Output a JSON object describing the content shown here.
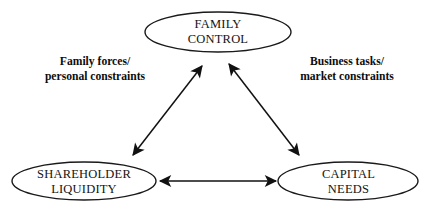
{
  "diagram": {
    "background_color": "#ffffff",
    "stroke_color": "#1a1a1a",
    "text_color": "#141414",
    "nodes": [
      {
        "id": "family-control",
        "line1": "FAMILY",
        "line2": "CONTROL",
        "cx": 218,
        "cy": 32,
        "rx": 73,
        "ry": 20
      },
      {
        "id": "shareholder-liquidity",
        "line1": "SHAREHOLDER",
        "line2": "LIQUIDITY",
        "cx": 84,
        "cy": 181,
        "rx": 72,
        "ry": 19
      },
      {
        "id": "capital-needs",
        "line1": "CAPITAL",
        "line2": "NEEDS",
        "cx": 348,
        "cy": 181,
        "rx": 70,
        "ry": 19
      }
    ],
    "edges": [
      {
        "id": "edge-left",
        "from": "shareholder-liquidity",
        "to": "family-control",
        "x1": 133,
        "y1": 155,
        "x2": 202,
        "y2": 66,
        "double_headed": true
      },
      {
        "id": "edge-right",
        "from": "family-control",
        "to": "capital-needs",
        "x1": 229,
        "y1": 64,
        "x2": 299,
        "y2": 155,
        "double_headed": true
      },
      {
        "id": "edge-bottom",
        "from": "shareholder-liquidity",
        "to": "capital-needs",
        "x1": 159,
        "y1": 181,
        "x2": 277,
        "y2": 181,
        "double_headed": true
      }
    ],
    "edge_labels": [
      {
        "id": "family-forces",
        "line1": "Family forces/",
        "line2": "personal constraints"
      },
      {
        "id": "business-tasks",
        "line1": "Business tasks/",
        "line2": "market constraints"
      }
    ]
  }
}
